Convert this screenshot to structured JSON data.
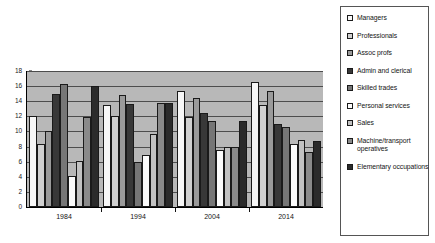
{
  "chart_data": {
    "type": "bar",
    "title": "",
    "subtitle": "",
    "xlabel": "",
    "ylabel": "",
    "categories": [
      "1984",
      "1994",
      "2004",
      "2014"
    ],
    "ylim": [
      0,
      18
    ],
    "ytick_step": 2,
    "yticks": [
      "18",
      "16",
      "14",
      "12",
      "10",
      "8",
      "6",
      "4",
      "2",
      "0"
    ],
    "grid": true,
    "grid_orientation": "horizontal",
    "legend_position": "right",
    "plot_background": "#b8b8b8",
    "series": [
      {
        "name": "Managers",
        "color": "#f7f7f7",
        "values": [
          12.1,
          13.5,
          15.3,
          16.6
        ]
      },
      {
        "name": "Professionals",
        "color": "#d0d0d0",
        "values": [
          8.4,
          12.0,
          11.9,
          13.5
        ]
      },
      {
        "name": "Assoc profs",
        "color": "#9a9a9a",
        "values": [
          10.1,
          14.8,
          14.4,
          15.3
        ]
      },
      {
        "name": "Admin and clerical",
        "color": "#383838",
        "values": [
          15.0,
          13.6,
          12.5,
          11.0
        ]
      },
      {
        "name": "Skilled trades",
        "color": "#767676",
        "values": [
          16.3,
          5.9,
          11.4,
          10.6
        ]
      },
      {
        "name": "Personal services",
        "color": "#fbfbfb",
        "values": [
          4.1,
          6.9,
          7.6,
          8.4
        ]
      },
      {
        "name": "Sales",
        "color": "#c2c2c2",
        "values": [
          6.1,
          9.7,
          8.0,
          8.9
        ]
      },
      {
        "name": "Machine/transport operatives",
        "color": "#8a8a8a",
        "values": [
          11.9,
          13.8,
          7.9,
          7.3
        ]
      },
      {
        "name": "Elementary occupations",
        "color": "#2b2b2b",
        "values": [
          16.0,
          13.8,
          11.4,
          8.7
        ]
      }
    ]
  }
}
